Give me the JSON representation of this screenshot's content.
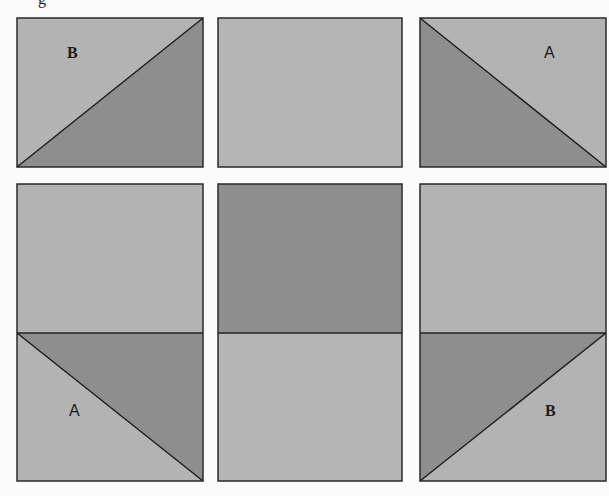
{
  "diagram": {
    "title_fragment": "g",
    "colors": {
      "background": "#fbfbfb",
      "light": "#b3b3b3",
      "dark": "#8e8e8e",
      "stroke": "#2a2a2a"
    },
    "rows": [
      {
        "tiles": [
          {
            "id": "top-left",
            "type": "half-square-triangle",
            "diagonal": "bottom-left-to-top-right",
            "light_region": "upper-left",
            "dark_region": "lower-right",
            "label": "B"
          },
          {
            "id": "top-center",
            "type": "solid",
            "fill": "light",
            "label": ""
          },
          {
            "id": "top-right",
            "type": "half-square-triangle",
            "diagonal": "top-left-to-bottom-right",
            "light_region": "upper-right",
            "dark_region": "lower-left",
            "label": "A"
          }
        ]
      },
      {
        "tiles": [
          {
            "id": "bottom-left",
            "type": "split",
            "top": "light",
            "bottom_diagonal": "top-left-to-bottom-right",
            "bottom_light_region": "lower-left",
            "bottom_dark_region": "upper-right",
            "label": "A"
          },
          {
            "id": "bottom-center",
            "type": "split",
            "top": "dark",
            "bottom": "light",
            "label": ""
          },
          {
            "id": "bottom-right",
            "type": "split",
            "top": "light",
            "bottom_diagonal": "bottom-left-to-top-right",
            "bottom_light_region": "lower-right",
            "bottom_dark_region": "upper-left",
            "label": "B"
          }
        ]
      }
    ],
    "labels": {
      "top_left": "B",
      "top_right": "A",
      "bottom_left": "A",
      "bottom_right": "B"
    }
  }
}
